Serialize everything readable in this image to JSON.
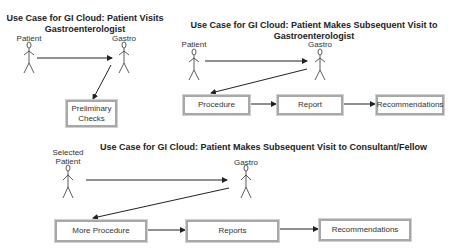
{
  "diagrams": [
    {
      "title_line1": "Use Case for GI Cloud: Patient Visits",
      "title_line2": "Gastroenterologist",
      "actors": [
        {
          "label": "Patient"
        },
        {
          "label": "Gastro"
        }
      ],
      "boxes": [
        {
          "line1": "Preliminary",
          "line2": "Checks"
        }
      ]
    },
    {
      "title_line1": "Use Case for GI Cloud: Patient Makes Subsequent Visit to",
      "title_line2": "Gastroenterologist",
      "actors": [
        {
          "label": "Patient"
        },
        {
          "label": "Gastro"
        }
      ],
      "boxes": [
        {
          "label": "Procedure"
        },
        {
          "label": "Report"
        },
        {
          "label": "Recommendations"
        }
      ]
    },
    {
      "title": "Use Case for GI Cloud: Patient Makes Subsequent Visit to Consultant/Fellow",
      "actors": [
        {
          "label_line1": "Selected",
          "label_line2": "Patient"
        },
        {
          "label": "Gastro"
        }
      ],
      "boxes": [
        {
          "label": "More Procedure"
        },
        {
          "label": "Reports"
        },
        {
          "label": "Recommendations"
        }
      ]
    }
  ],
  "colors": {
    "line": "#222222",
    "box_border": "#a8a8a8",
    "text": "#222222"
  }
}
